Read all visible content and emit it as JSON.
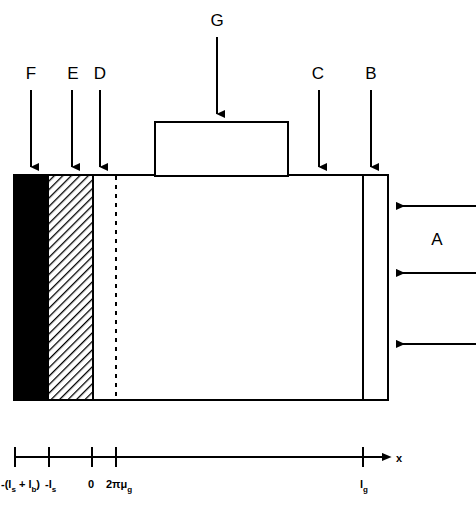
{
  "figure": {
    "type": "cross-section-schematic",
    "background_color": "#ffffff",
    "line_color": "#000000"
  },
  "callouts": [
    {
      "id": "A",
      "label": "A",
      "label_x": 437,
      "label_y": 245,
      "direction": "left",
      "description": "three horizontal arrows pointing left at right edge of body"
    },
    {
      "id": "B",
      "label": "B",
      "label_x": 371,
      "label_y": 74,
      "direction": "down",
      "description": "arrow to narrow right strip of body"
    },
    {
      "id": "C",
      "label": "C",
      "label_x": 318,
      "label_y": 74,
      "direction": "down",
      "description": "arrow to top surface of main body"
    },
    {
      "id": "D",
      "label": "D",
      "label_x": 100,
      "label_y": 74,
      "direction": "down",
      "description": "arrow to white layer left of dashed line"
    },
    {
      "id": "E",
      "label": "E",
      "label_x": 74,
      "label_y": 74,
      "direction": "down",
      "description": "arrow to hatched layer"
    },
    {
      "id": "F",
      "label": "F",
      "label_x": 31,
      "label_y": 74,
      "direction": "down",
      "description": "arrow to solid black layer"
    },
    {
      "id": "G",
      "label": "G",
      "label_x": 217,
      "label_y": 20,
      "direction": "down",
      "description": "arrow to raised block on top"
    }
  ],
  "layers": [
    {
      "name": "black-layer",
      "fill": "solid-black",
      "x_start": 14,
      "x_end": 48
    },
    {
      "name": "hatched-layer",
      "fill": "diagonal-hatch",
      "x_start": 48,
      "x_end": 93
    },
    {
      "name": "white-layer",
      "fill": "white",
      "x_start": 93,
      "x_end": 388
    }
  ],
  "body": {
    "x": 14,
    "y": 175,
    "width": 374,
    "height": 225
  },
  "top_block": {
    "x": 155,
    "y": 122,
    "width": 133,
    "height": 53
  },
  "dashed_boundary": {
    "x": 116
  },
  "inner_vertical_line": {
    "x": 363
  },
  "axis": {
    "name": "x",
    "y": 457,
    "x_start": 15,
    "x_end": 390,
    "ticks": [
      {
        "x": 15,
        "main": "-(l",
        "sub1": "s",
        "mid": " + l",
        "sub2": "b",
        "tail": ")",
        "text": "-(ls + lb)"
      },
      {
        "x": 49,
        "main": "-l",
        "sub1": "s",
        "text": "-ls"
      },
      {
        "x": 92,
        "main": "0",
        "text": "0"
      },
      {
        "x": 116,
        "main": "2πμ",
        "sub1": "g",
        "text": "2πμg"
      },
      {
        "x": 363,
        "main": "l",
        "sub1": "g",
        "text": "lg"
      }
    ]
  }
}
